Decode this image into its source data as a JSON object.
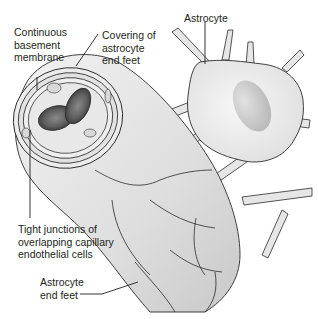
{
  "diagram": {
    "labels": {
      "basement_membrane": "Continuous\nbasement\nmembrane",
      "astrocyte_covering": "Covering of\nastrocyte\nend feet",
      "astrocyte": "Astrocyte",
      "tight_junctions": "Tight junctions of\noverlapping capillary\nendothelial cells",
      "end_feet": "Astrocyte\nend feet"
    },
    "colors": {
      "background": "#ffffff",
      "cell_fill": "#e4e4e4",
      "cell_fill_dark": "#cfcfcf",
      "outline": "#2b2b2b",
      "nucleus": "#c8c8c8",
      "red_blood_cell": "#555555",
      "red_blood_cell_center": "#7a7a7a",
      "text": "#231f20"
    }
  }
}
